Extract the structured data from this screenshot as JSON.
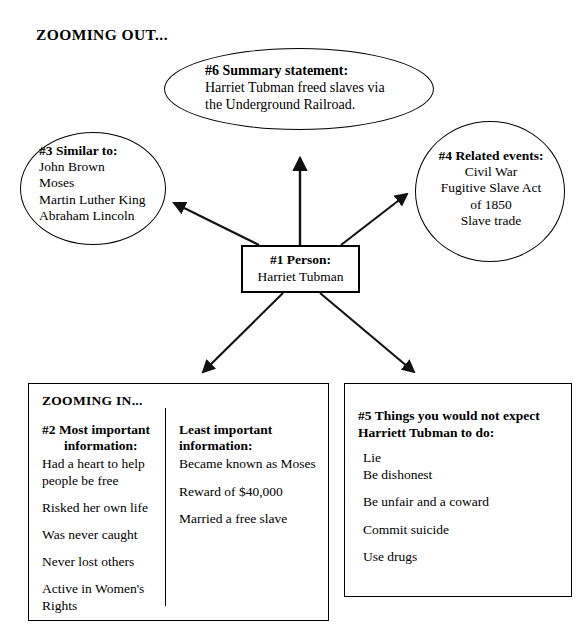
{
  "document": {
    "zooming_out_label": "ZOOMING OUT...",
    "zooming_in_label": "ZOOMING IN..."
  },
  "summary": {
    "heading": "#6 Summary statement:",
    "line1": "Harriet Tubman freed slaves via",
    "line2": "the Underground Railroad."
  },
  "similar_to": {
    "heading": "#3 Similar to:",
    "items": [
      "John Brown",
      "Moses",
      "Martin Luther King",
      "Abraham Lincoln"
    ]
  },
  "related_events": {
    "heading": "#4 Related events:",
    "items": [
      "Civil War",
      "Fugitive Slave Act",
      "of 1850",
      "Slave trade"
    ]
  },
  "person": {
    "heading": "#1 Person:",
    "name": "Harriet Tubman"
  },
  "most_important": {
    "heading_line1": "#2 Most important",
    "heading_line2": "information:",
    "items": [
      "Had a heart to help people be free",
      "Risked her own life",
      "Was never caught",
      "Never lost others",
      "Active in Women's Rights"
    ]
  },
  "least_important": {
    "heading_line1": "Least important",
    "heading_line2": "information:",
    "items": [
      "Became known as Moses",
      "Reward of $40,000",
      "Married a free slave"
    ]
  },
  "not_expect": {
    "heading_line1": "#5 Things you would not expect",
    "heading_line2": "Harriett Tubman to do:",
    "items": [
      "Lie",
      "Be dishonest",
      "Be unfair and a coward",
      "Commit suicide",
      "Use drugs"
    ]
  },
  "colors": {
    "ink": "#000000",
    "background": "#ffffff"
  },
  "arrows": [
    {
      "name": "person-to-summary",
      "from": "#1 Person",
      "to": "#6 Summary statement"
    },
    {
      "name": "person-to-similar",
      "from": "#1 Person",
      "to": "#3 Similar to"
    },
    {
      "name": "person-to-related",
      "from": "#1 Person",
      "to": "#4 Related events"
    },
    {
      "name": "person-to-zooming-in",
      "from": "#1 Person",
      "to": "ZOOMING IN"
    },
    {
      "name": "person-to-not-expect",
      "from": "#1 Person",
      "to": "#5 Things you would not expect"
    }
  ]
}
